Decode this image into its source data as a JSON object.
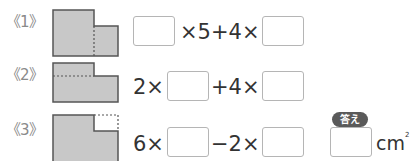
{
  "problems": [
    {
      "label": "《1》",
      "figure": "L-shape split vertically by dotted line",
      "expression": [
        {
          "type": "blank"
        },
        {
          "type": "text",
          "value": "×5+4×"
        },
        {
          "type": "blank"
        }
      ]
    },
    {
      "label": "《2》",
      "figure": "L-shape split horizontally by dotted line",
      "expression": [
        {
          "type": "text",
          "value": "2×"
        },
        {
          "type": "blank"
        },
        {
          "type": "text",
          "value": "+4×"
        },
        {
          "type": "blank"
        }
      ]
    },
    {
      "label": "《3》",
      "figure": "Rectangle with dotted missing corner",
      "expression": [
        {
          "type": "text",
          "value": "6×"
        },
        {
          "type": "blank"
        },
        {
          "type": "text",
          "value": "−2×"
        },
        {
          "type": "blank"
        }
      ]
    }
  ],
  "answer": {
    "badge_label": "答え",
    "value": "",
    "unit": "cm",
    "unit_exponent": "2"
  },
  "colors": {
    "shape_fill": "#c8c8c8",
    "shape_stroke": "#555555",
    "badge_bg": "#5a5a5a"
  }
}
